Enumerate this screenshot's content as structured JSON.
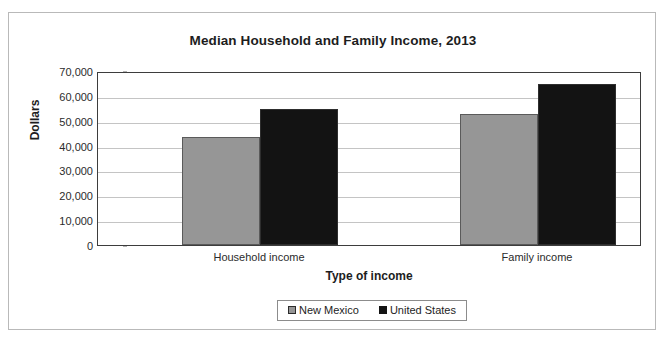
{
  "chart_data": {
    "type": "bar",
    "title": "Median Household and Family Income, 2013",
    "xlabel": "Type of income",
    "ylabel": "Dollars",
    "categories": [
      "Household income",
      "Family income"
    ],
    "series": [
      {
        "name": "New Mexico",
        "color": "#969696",
        "values": [
          43500,
          52600
        ]
      },
      {
        "name": "United States",
        "color": "#131313",
        "values": [
          54800,
          64900
        ]
      }
    ],
    "ylim": [
      0,
      70000
    ],
    "ytick_values": [
      70000,
      60000,
      50000,
      40000,
      30000,
      20000,
      10000,
      0
    ],
    "ytick_labels": [
      "70,000",
      "60,000",
      "50,000",
      "40,000",
      "30,000",
      "20,000",
      "10,000",
      "0"
    ],
    "grid": true,
    "legend_position": "bottom"
  },
  "bars": [
    {
      "label": "New Mexico - Household income",
      "value": 43500
    },
    {
      "label": "United States - Household income",
      "value": 52600
    },
    {
      "label": "New Mexico - Family income",
      "value": 54800
    },
    {
      "label": "United States - Family income",
      "value": 64900
    }
  ],
  "legend": {
    "items": [
      {
        "label": "New Mexico",
        "swatch": "gray-square-icon"
      },
      {
        "label": "United States",
        "swatch": "black-square-icon"
      }
    ]
  }
}
